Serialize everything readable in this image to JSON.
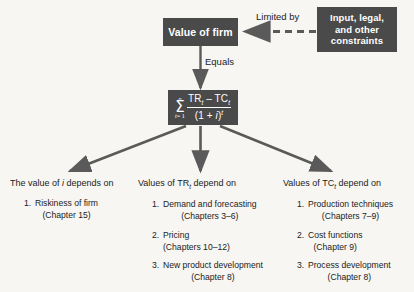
{
  "diagram": {
    "colors": {
      "box_fill": "#4a4a4a",
      "box_text": "#ffffff",
      "background": "#f7f6f2",
      "arrow": "#5a5a5a",
      "body_text": "#1c1c1c"
    },
    "nodes": {
      "value_of_firm": "Value of firm",
      "constraints_lines": [
        "Input, legal,",
        "and other",
        "constraints"
      ],
      "formula": {
        "sigma": "Σ",
        "upper_limit": "n",
        "lower_limit_var": "t",
        "lower_limit_value": "= 1",
        "numerator_pre": "TR",
        "numerator_sub1": "t",
        "numerator_mid": " – TC",
        "numerator_sub2": "t",
        "denominator_pre": "(1 + ",
        "denominator_var": "i",
        "denominator_post": ")",
        "denominator_exp": "t",
        "plain": "Σ (t=1 to n) of (TR_t – TC_t) / (1 + i)^t"
      }
    },
    "edges": {
      "limited_by": "Limited by",
      "equals": "Equals"
    },
    "columns": [
      {
        "id": "i",
        "heading_pre": "The value of ",
        "heading_var": "i",
        "heading_post": " depends on",
        "items": [
          {
            "num": "1.",
            "text": "Riskiness of firm",
            "chapter": "(Chapter 15)"
          }
        ]
      },
      {
        "id": "tr",
        "heading_pre": "Values of TR",
        "heading_sub": "t",
        "heading_post": " depend on",
        "items": [
          {
            "num": "1.",
            "text": "Demand and forecasting",
            "chapter": "(Chapters 3–6)"
          },
          {
            "num": "2.",
            "text": "Pricing",
            "chapter": "(Chapters 10–12)"
          },
          {
            "num": "3.",
            "text": "New product development",
            "chapter": "(Chapter 8)"
          }
        ]
      },
      {
        "id": "tc",
        "heading_pre": "Values of TC",
        "heading_sub": "t",
        "heading_post": " depend on",
        "items": [
          {
            "num": "1.",
            "text": "Production techniques",
            "chapter": "(Chapters 7–9)"
          },
          {
            "num": "2.",
            "text": "Cost functions",
            "chapter": "(Chapter 9)"
          },
          {
            "num": "3.",
            "text": "Process development",
            "chapter": "(Chapter 8)"
          }
        ]
      }
    ]
  }
}
